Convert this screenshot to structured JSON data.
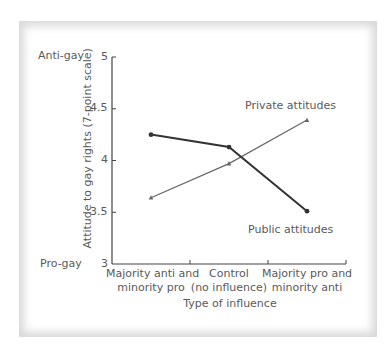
{
  "chart_data": {
    "type": "line",
    "title": "",
    "xlabel": "Type of influence",
    "ylabel": "Attitude to gay rights (7-point scale)",
    "categories": [
      "Majority anti and minority pro",
      "Control (no influence)",
      "Majority pro and minority anti"
    ],
    "category_lines": [
      [
        "Majority anti and",
        "minority pro"
      ],
      [
        "Control",
        "(no influence)"
      ],
      [
        "Majority pro and",
        "minority anti"
      ]
    ],
    "ylim": [
      3,
      5
    ],
    "yticks": [
      "3",
      "3.5",
      "4",
      "4.5",
      "5"
    ],
    "y_anchor_labels": {
      "top": "Anti-gay",
      "bottom": "Pro-gay"
    },
    "grid": false,
    "series": [
      {
        "name": "Public attitudes",
        "values": [
          4.25,
          4.13,
          3.51
        ],
        "color": "#333333",
        "marker": "circle"
      },
      {
        "name": "Private attitudes",
        "values": [
          3.64,
          3.97,
          4.39
        ],
        "color": "#666666",
        "marker": "triangle"
      }
    ],
    "annotations": [
      {
        "text": "Private attitudes",
        "near_series": "Private attitudes"
      },
      {
        "text": "Public attitudes",
        "near_series": "Public attitudes"
      }
    ]
  },
  "labels": {
    "anti_gay": "Anti-gay",
    "pro_gay": "Pro-gay",
    "private": "Private attitudes",
    "public": "Public attitudes",
    "xlabel": "Type of influence",
    "ylabel": "Attitude to gay rights (7-point scale)",
    "ticks": {
      "t5": "5",
      "t45": "4.5",
      "t4": "4",
      "t35": "3.5",
      "t3": "3"
    },
    "cat1a": "Majority anti and",
    "cat1b": "minority pro",
    "cat2a": "Control",
    "cat2b": "(no influence)",
    "cat3a": "Majority pro and",
    "cat3b": "minority anti"
  }
}
